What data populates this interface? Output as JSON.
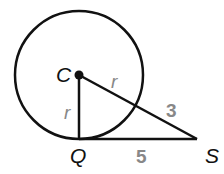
{
  "diagram": {
    "points": {
      "C": "C",
      "Q": "Q",
      "S": "S"
    },
    "labels": {
      "radius_vertical": "r",
      "radius_slant": "r",
      "external_segment": "3",
      "tangent_segment": "5"
    },
    "colors": {
      "lines": "#111111",
      "measure_labels": "#888888"
    }
  }
}
